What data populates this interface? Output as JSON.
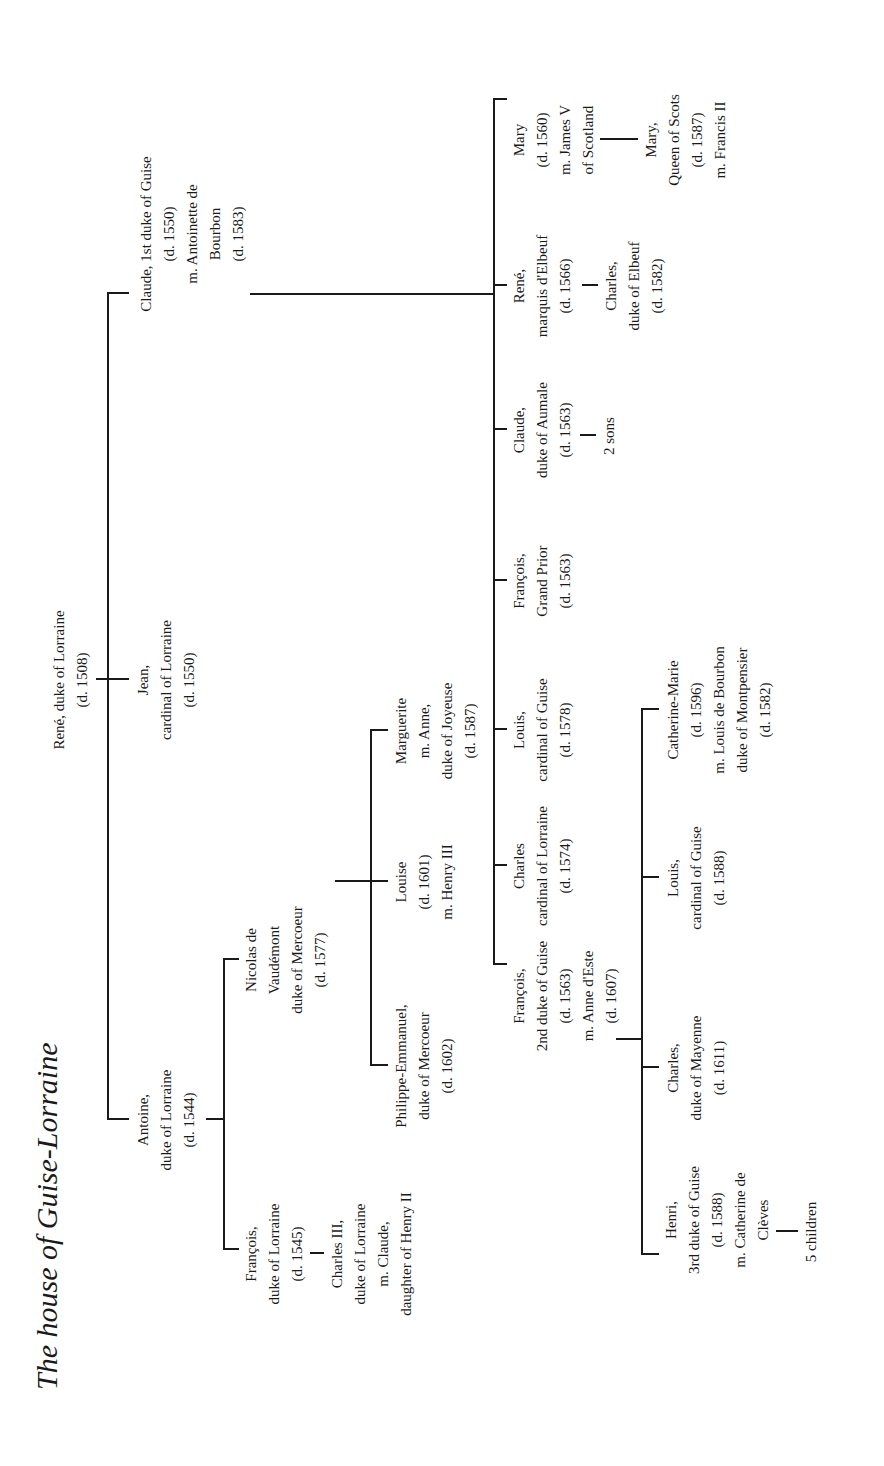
{
  "title": "The house of Guise-Lorraine",
  "root": {
    "lines": [
      "René, duke of Lorraine",
      "(d. 1508)"
    ]
  },
  "gen1": {
    "antoine": {
      "lines": [
        "Antoine,",
        "duke of Lorraine",
        "(d. 1544)"
      ]
    },
    "jean": {
      "lines": [
        "Jean,",
        "cardinal of Lorraine",
        "(d. 1550)"
      ]
    },
    "claude": {
      "lines": [
        "Claude, 1st duke of Guise",
        "(d. 1550)",
        "m. Antoinette de",
        "Bourbon",
        "(d. 1583)"
      ]
    }
  },
  "antoine_children": {
    "francois": {
      "lines": [
        "François,",
        "duke of Lorraine",
        "(d. 1545)"
      ]
    },
    "charles3": {
      "lines": [
        "Charles III,",
        "duke of Lorraine",
        "m. Claude,",
        "daughter of Henry II"
      ]
    },
    "nicolas": {
      "lines": [
        "Nicolas de",
        "Vaudémont",
        "duke of Mercoeur",
        "(d. 1577)"
      ]
    }
  },
  "nicolas_children": {
    "philippe": {
      "lines": [
        "Philippe-Emmanuel,",
        "duke of Mercoeur",
        "(d. 1602)"
      ]
    },
    "louise": {
      "lines": [
        "Louise",
        "(d. 1601)",
        "m. Henry III"
      ]
    },
    "marguerite": {
      "lines": [
        "Marguerite",
        "m. Anne,",
        "duke of Joyeuse",
        "(d. 1587)"
      ]
    }
  },
  "claude_children": {
    "francois2": {
      "lines": [
        "François,",
        "2nd duke of Guise",
        "(d. 1563)",
        "m. Anne d'Este",
        "(d. 1607)"
      ]
    },
    "charles_card": {
      "lines": [
        "Charles",
        "cardinal of Lorraine",
        "(d. 1574)"
      ]
    },
    "louis_card": {
      "lines": [
        "Louis,",
        "cardinal of Guise",
        "(d. 1578)"
      ]
    },
    "francois_prior": {
      "lines": [
        "François,",
        "Grand Prior",
        "(d. 1563)"
      ]
    },
    "claude_aumale": {
      "lines": [
        "Claude,",
        "duke of Aumale",
        "(d. 1563)"
      ]
    },
    "aumale_sons": {
      "lines": [
        "2 sons"
      ]
    },
    "rene_elbeuf": {
      "lines": [
        "René,",
        "marquis d'Elbeuf",
        "(d. 1566)"
      ]
    },
    "charles_elbeuf": {
      "lines": [
        "Charles,",
        "duke of Elbeuf",
        "(d. 1582)"
      ]
    },
    "mary": {
      "lines": [
        "Mary",
        "(d. 1560)",
        "m. James V",
        "of Scotland"
      ]
    },
    "mary_qos": {
      "lines": [
        "Mary,",
        "Queen of Scots",
        "(d. 1587)",
        "m. Francis II"
      ]
    }
  },
  "francois2_children": {
    "henri": {
      "lines": [
        "Henri,",
        "3rd duke of Guise",
        "(d. 1588)",
        "m. Catherine de",
        "Clèves"
      ]
    },
    "henri_children": {
      "lines": [
        "5 children"
      ]
    },
    "charles_mayenne": {
      "lines": [
        "Charles,",
        "duke of Mayenne",
        "(d. 1611)"
      ]
    },
    "louis_card2": {
      "lines": [
        "Louis,",
        "cardinal of Guise",
        "(d. 1588)"
      ]
    },
    "catherine_marie": {
      "lines": [
        "Catherine-Marie",
        "(d. 1596)",
        "m. Louis de Bourbon",
        "duke of Montpensier",
        "(d. 1582)"
      ]
    }
  }
}
